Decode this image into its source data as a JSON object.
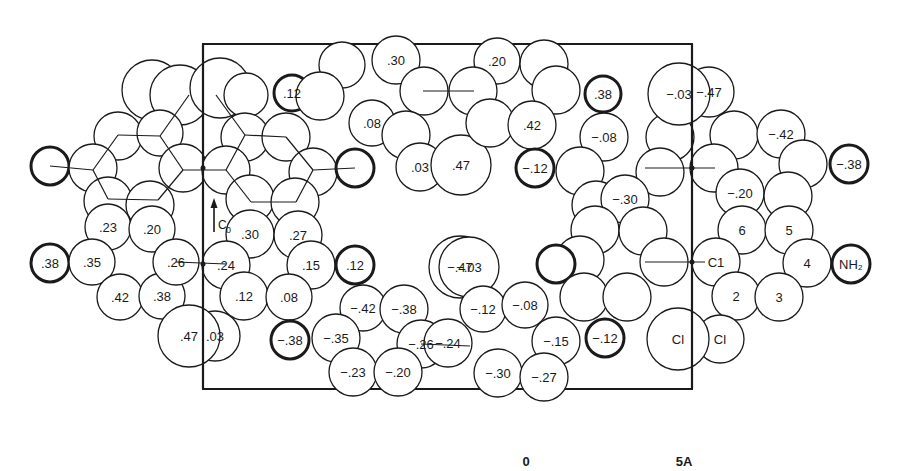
{
  "diagram": {
    "axis_label": "C",
    "axis_subscript": "0",
    "scale": {
      "start_label": "0",
      "end_label": "5A"
    },
    "unit_cell_box": {
      "x": 203,
      "y": 44,
      "width": 489,
      "height": 345
    },
    "atoms": [
      {
        "cx": 152,
        "cy": 90,
        "r": 30,
        "label": ""
      },
      {
        "cx": 180,
        "cy": 95,
        "r": 30,
        "label": ""
      },
      {
        "cx": 118,
        "cy": 136,
        "r": 24,
        "label": ""
      },
      {
        "cx": 160,
        "cy": 133,
        "r": 23,
        "label": ""
      },
      {
        "cx": 50,
        "cy": 166,
        "r": 19,
        "label": "",
        "bold": true
      },
      {
        "cx": 93,
        "cy": 168,
        "r": 24,
        "label": ""
      },
      {
        "cx": 183,
        "cy": 168,
        "r": 24,
        "label": ""
      },
      {
        "cx": 108,
        "cy": 201,
        "r": 24,
        "label": ""
      },
      {
        "cx": 150,
        "cy": 205,
        "r": 24,
        "label": ""
      },
      {
        "cx": 108,
        "cy": 227,
        "r": 23,
        "label": ".23"
      },
      {
        "cx": 152,
        "cy": 229,
        "r": 23,
        "label": ".20"
      },
      {
        "cx": 50,
        "cy": 263,
        "r": 19,
        "label": ".38",
        "bold": true
      },
      {
        "cx": 92,
        "cy": 262,
        "r": 23,
        "label": ".35"
      },
      {
        "cx": 120,
        "cy": 297,
        "r": 23,
        "label": ".42"
      },
      {
        "cx": 162,
        "cy": 296,
        "r": 23,
        "label": ".38"
      },
      {
        "cx": 176,
        "cy": 262,
        "r": 23,
        "label": ".26"
      },
      {
        "cx": 215,
        "cy": 336,
        "r": 25,
        "label": ".03"
      },
      {
        "cx": 189,
        "cy": 336,
        "r": 31,
        "label": ".47"
      },
      {
        "cx": 220,
        "cy": 88,
        "r": 30,
        "label": ""
      },
      {
        "cx": 246,
        "cy": 95,
        "r": 22,
        "label": ""
      },
      {
        "cx": 245,
        "cy": 137,
        "r": 24,
        "label": ""
      },
      {
        "cx": 286,
        "cy": 137,
        "r": 24,
        "label": ""
      },
      {
        "cx": 226,
        "cy": 170,
        "r": 24,
        "label": ""
      },
      {
        "cx": 313,
        "cy": 172,
        "r": 24,
        "label": ""
      },
      {
        "cx": 250,
        "cy": 199,
        "r": 24,
        "label": ""
      },
      {
        "cx": 295,
        "cy": 202,
        "r": 24,
        "label": ""
      },
      {
        "cx": 292,
        "cy": 93,
        "r": 18,
        "label": ".12",
        "bold": true
      },
      {
        "cx": 355,
        "cy": 168,
        "r": 19,
        "label": "",
        "bold": true
      },
      {
        "cx": 250,
        "cy": 234,
        "r": 24,
        "label": ".30"
      },
      {
        "cx": 298,
        "cy": 235,
        "r": 24,
        "label": ".27"
      },
      {
        "cx": 226,
        "cy": 265,
        "r": 24,
        "label": ".24"
      },
      {
        "cx": 311,
        "cy": 265,
        "r": 24,
        "label": ".15"
      },
      {
        "cx": 244,
        "cy": 296,
        "r": 24,
        "label": ".12"
      },
      {
        "cx": 289,
        "cy": 297,
        "r": 23,
        "label": ".08"
      },
      {
        "cx": 290,
        "cy": 340,
        "r": 19,
        "label": "−.38",
        "bold": true
      },
      {
        "cx": 355,
        "cy": 265,
        "r": 19,
        "label": ".12",
        "bold": true
      },
      {
        "cx": 460,
        "cy": 267,
        "r": 31,
        "label": "−.47"
      },
      {
        "cx": 469,
        "cy": 267,
        "r": 30,
        "label": "−.03"
      },
      {
        "cx": 363,
        "cy": 308,
        "r": 23,
        "label": "−.42"
      },
      {
        "cx": 404,
        "cy": 309,
        "r": 24,
        "label": "−.38"
      },
      {
        "cx": 336,
        "cy": 338,
        "r": 24,
        "label": "−.35"
      },
      {
        "cx": 421,
        "cy": 344,
        "r": 24,
        "label": "−.26"
      },
      {
        "cx": 353,
        "cy": 372,
        "r": 24,
        "label": "−.23"
      },
      {
        "cx": 398,
        "cy": 372,
        "r": 24,
        "label": "−.20"
      },
      {
        "cx": 342,
        "cy": 65,
        "r": 23,
        "label": ""
      },
      {
        "cx": 396,
        "cy": 60,
        "r": 24,
        "label": ".30"
      },
      {
        "cx": 320,
        "cy": 96,
        "r": 24,
        "label": ""
      },
      {
        "cx": 372,
        "cy": 123,
        "r": 23,
        "label": ".08"
      },
      {
        "cx": 424,
        "cy": 91,
        "r": 24,
        "label": ""
      },
      {
        "cx": 406,
        "cy": 135,
        "r": 24,
        "label": ""
      },
      {
        "cx": 420,
        "cy": 167,
        "r": 24,
        "label": ".03"
      },
      {
        "cx": 461,
        "cy": 165,
        "r": 30,
        "label": ".47"
      },
      {
        "cx": 497,
        "cy": 61,
        "r": 23,
        "label": ".20"
      },
      {
        "cx": 473,
        "cy": 91,
        "r": 24,
        "label": ""
      },
      {
        "cx": 544,
        "cy": 64,
        "r": 24,
        "label": ""
      },
      {
        "cx": 556,
        "cy": 90,
        "r": 24,
        "label": ""
      },
      {
        "cx": 490,
        "cy": 123,
        "r": 24,
        "label": ""
      },
      {
        "cx": 532,
        "cy": 125,
        "r": 24,
        "label": ".42"
      },
      {
        "cx": 535,
        "cy": 168,
        "r": 19,
        "label": "−.12",
        "bold": true
      },
      {
        "cx": 603,
        "cy": 94,
        "r": 18,
        "label": ".38",
        "bold": true
      },
      {
        "cx": 604,
        "cy": 137,
        "r": 24,
        "label": "−.08"
      },
      {
        "cx": 580,
        "cy": 171,
        "r": 24,
        "label": ""
      },
      {
        "cx": 670,
        "cy": 137,
        "r": 24,
        "label": ""
      },
      {
        "cx": 660,
        "cy": 172,
        "r": 24,
        "label": ""
      },
      {
        "cx": 596,
        "cy": 205,
        "r": 24,
        "label": ""
      },
      {
        "cx": 625,
        "cy": 199,
        "r": 24,
        "label": "−.30"
      },
      {
        "cx": 595,
        "cy": 230,
        "r": 24,
        "label": ""
      },
      {
        "cx": 643,
        "cy": 231,
        "r": 24,
        "label": ""
      },
      {
        "cx": 580,
        "cy": 260,
        "r": 24,
        "label": ""
      },
      {
        "cx": 664,
        "cy": 262,
        "r": 24,
        "label": ""
      },
      {
        "cx": 556,
        "cy": 264,
        "r": 19,
        "label": "",
        "bold": true
      },
      {
        "cx": 584,
        "cy": 297,
        "r": 24,
        "label": ""
      },
      {
        "cx": 627,
        "cy": 297,
        "r": 24,
        "label": ""
      },
      {
        "cx": 483,
        "cy": 309,
        "r": 23,
        "label": "−.12"
      },
      {
        "cx": 525,
        "cy": 305,
        "r": 23,
        "label": "−.08"
      },
      {
        "cx": 448,
        "cy": 343,
        "r": 24,
        "label": "−.24"
      },
      {
        "cx": 556,
        "cy": 341,
        "r": 24,
        "label": "−.15"
      },
      {
        "cx": 605,
        "cy": 338,
        "r": 19,
        "label": "−.12",
        "bold": true
      },
      {
        "cx": 498,
        "cy": 373,
        "r": 24,
        "label": "−.30"
      },
      {
        "cx": 544,
        "cy": 377,
        "r": 24,
        "label": "−.27"
      },
      {
        "cx": 709,
        "cy": 92,
        "r": 25,
        "label": "−.47"
      },
      {
        "cx": 679,
        "cy": 94,
        "r": 31,
        "label": "−.03"
      },
      {
        "cx": 734,
        "cy": 135,
        "r": 24,
        "label": ""
      },
      {
        "cx": 781,
        "cy": 134,
        "r": 24,
        "label": "−.42"
      },
      {
        "cx": 714,
        "cy": 168,
        "r": 24,
        "label": ""
      },
      {
        "cx": 803,
        "cy": 164,
        "r": 24,
        "label": ""
      },
      {
        "cx": 740,
        "cy": 193,
        "r": 24,
        "label": "−.20"
      },
      {
        "cx": 788,
        "cy": 196,
        "r": 24,
        "label": ""
      },
      {
        "cx": 849,
        "cy": 164,
        "r": 19,
        "label": "−.38",
        "bold": true
      },
      {
        "cx": 742,
        "cy": 230,
        "r": 24,
        "label": "6"
      },
      {
        "cx": 789,
        "cy": 230,
        "r": 24,
        "label": "5"
      },
      {
        "cx": 716,
        "cy": 262,
        "r": 24,
        "label": "C1"
      },
      {
        "cx": 807,
        "cy": 263,
        "r": 24,
        "label": "4"
      },
      {
        "cx": 736,
        "cy": 296,
        "r": 24,
        "label": "2"
      },
      {
        "cx": 779,
        "cy": 297,
        "r": 24,
        "label": "3"
      },
      {
        "cx": 851,
        "cy": 264,
        "r": 19,
        "label": "NH₂",
        "bold": true
      },
      {
        "cx": 720,
        "cy": 339,
        "r": 24,
        "label": "Cl"
      },
      {
        "cx": 678,
        "cy": 339,
        "r": 31,
        "label": "Cl"
      }
    ],
    "bonds": [
      {
        "x1": 50,
        "y1": 166,
        "x2": 93,
        "y2": 170
      },
      {
        "x1": 93,
        "y1": 170,
        "x2": 118,
        "y2": 135
      },
      {
        "x1": 118,
        "y1": 135,
        "x2": 160,
        "y2": 136
      },
      {
        "x1": 160,
        "y1": 136,
        "x2": 183,
        "y2": 170
      },
      {
        "x1": 183,
        "y1": 170,
        "x2": 158,
        "y2": 200
      },
      {
        "x1": 158,
        "y1": 200,
        "x2": 108,
        "y2": 199
      },
      {
        "x1": 108,
        "y1": 199,
        "x2": 93,
        "y2": 170
      },
      {
        "x1": 160,
        "y1": 136,
        "x2": 189,
        "y2": 95
      },
      {
        "x1": 183,
        "y1": 170,
        "x2": 226,
        "y2": 170
      },
      {
        "x1": 226,
        "y1": 170,
        "x2": 245,
        "y2": 135
      },
      {
        "x1": 245,
        "y1": 135,
        "x2": 286,
        "y2": 137
      },
      {
        "x1": 286,
        "y1": 137,
        "x2": 313,
        "y2": 170
      },
      {
        "x1": 313,
        "y1": 170,
        "x2": 296,
        "y2": 202
      },
      {
        "x1": 296,
        "y1": 202,
        "x2": 251,
        "y2": 202
      },
      {
        "x1": 251,
        "y1": 202,
        "x2": 226,
        "y2": 170
      },
      {
        "x1": 245,
        "y1": 135,
        "x2": 216,
        "y2": 95
      },
      {
        "x1": 313,
        "y1": 170,
        "x2": 355,
        "y2": 168
      },
      {
        "x1": 176,
        "y1": 262,
        "x2": 226,
        "y2": 264
      },
      {
        "x1": 423,
        "y1": 91,
        "x2": 474,
        "y2": 91
      },
      {
        "x1": 421,
        "y1": 344,
        "x2": 470,
        "y2": 346
      },
      {
        "x1": 645,
        "y1": 168,
        "x2": 715,
        "y2": 168
      },
      {
        "x1": 645,
        "y1": 262,
        "x2": 705,
        "y2": 262
      }
    ],
    "axis_line": {
      "x": 203,
      "y1": 44,
      "y2": 389
    },
    "center_line": {
      "x": 692,
      "y1": 44,
      "y2": 389
    }
  }
}
